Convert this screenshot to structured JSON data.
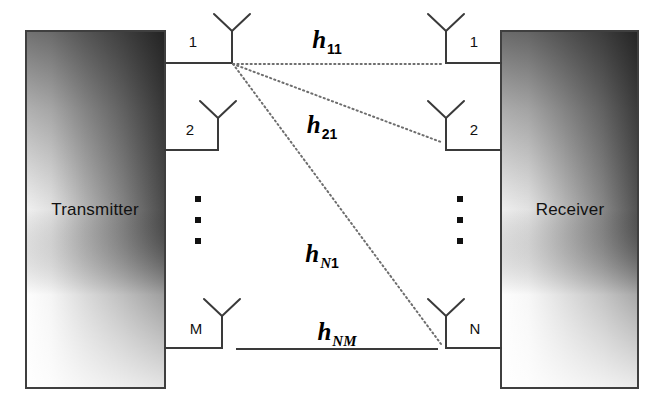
{
  "figure": {
    "background_color": "#ffffff",
    "line_color": "#3a3a3a",
    "dotted_color": "#6e6e6e",
    "text_color": "#111111"
  },
  "transmitter": {
    "label": "Transmitter",
    "antenna_labels": [
      "1",
      "2",
      "M"
    ],
    "ellipsis": "⋮"
  },
  "receiver": {
    "label": "Receiver",
    "antenna_labels": [
      "1",
      "2",
      "N"
    ],
    "ellipsis": "⋮"
  },
  "channels": [
    {
      "symbol": "h",
      "sub_first": "1",
      "sub_second": "1",
      "style": "dotted"
    },
    {
      "symbol": "h",
      "sub_first": "2",
      "sub_second": "1",
      "style": "dotted"
    },
    {
      "symbol": "h",
      "sub_first": "N",
      "sub_second": "1",
      "style": "dotted"
    },
    {
      "symbol": "h",
      "sub_first": "N",
      "sub_second": "M",
      "style": "solid"
    }
  ]
}
